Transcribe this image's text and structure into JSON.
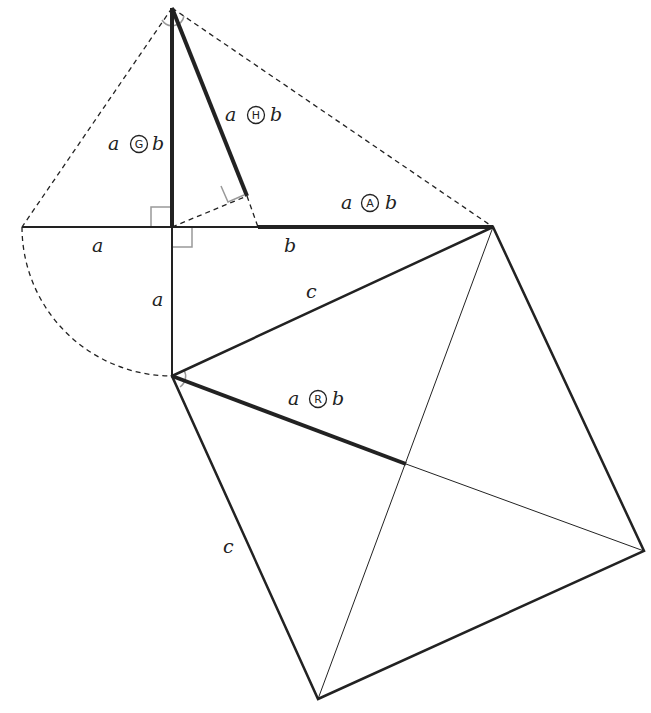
{
  "diagram": {
    "type": "geometric construction of means (Pythagorean square)",
    "colors": {
      "line": "#222222",
      "angle_mark": "#999999",
      "background": "#ffffff"
    },
    "points": {
      "top": [
        172,
        8
      ],
      "left": [
        22,
        227
      ],
      "foot": [
        172,
        227
      ],
      "mid": [
        258,
        227
      ],
      "h_foot": [
        247,
        196
      ],
      "right": [
        493,
        227
      ],
      "lower": [
        172,
        376
      ],
      "sq_right": [
        644,
        551
      ],
      "sq_bottom": [
        318,
        699
      ],
      "sq_center": [
        406,
        464
      ]
    },
    "labels": {
      "seg_a_horizontal": "a",
      "seg_b_horizontal": "b",
      "seg_a_vertical": "a",
      "hyp_c_upper": "c",
      "side_c_left": "c",
      "geometric_mean": {
        "left": "a",
        "symbol": "G",
        "right": "b"
      },
      "harmonic_mean": {
        "left": "a",
        "symbol": "H",
        "right": "b"
      },
      "arithmetic_mean": {
        "left": "a",
        "symbol": "A",
        "right": "b"
      },
      "rms_mean": {
        "left": "a",
        "symbol": "R",
        "right": "b"
      }
    }
  }
}
